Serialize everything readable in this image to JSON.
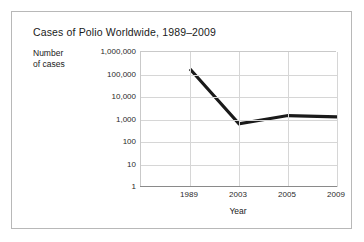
{
  "figure": {
    "title": "Cases of Polio Worldwide, 1989–2009",
    "y_axis_label_line1": "Number",
    "y_axis_label_line2": "of cases",
    "x_axis_title": "Year",
    "frame_color": "#b8b8b8",
    "grid_color": "#d6d6d6",
    "line_color": "#1a1a1a"
  },
  "chart_data": {
    "type": "line",
    "title": "Cases of Polio Worldwide, 1989–2009",
    "xlabel": "Year",
    "ylabel": "Number of cases",
    "yscale": "log",
    "ylim": [
      1,
      1000000
    ],
    "grid": true,
    "legend": "none",
    "categories": [
      "1989",
      "2003",
      "2005",
      "2009"
    ],
    "values": [
      175000,
      650,
      1500,
      1300
    ],
    "ytick_labels": [
      "1,000,000",
      "100,000",
      "10,000",
      "1,000",
      "100",
      "10",
      "1"
    ],
    "ytick_values": [
      1000000,
      100000,
      10000,
      1000,
      100,
      10,
      1
    ],
    "xtick_labels": [
      "1989",
      "2003",
      "2005",
      "2009"
    ],
    "series": [
      {
        "name": "Polio cases",
        "points": [
          {
            "x": "1989",
            "y": 175000
          },
          {
            "x": "2003",
            "y": 650
          },
          {
            "x": "2005",
            "y": 1500
          },
          {
            "x": "2009",
            "y": 1300
          }
        ]
      }
    ]
  }
}
